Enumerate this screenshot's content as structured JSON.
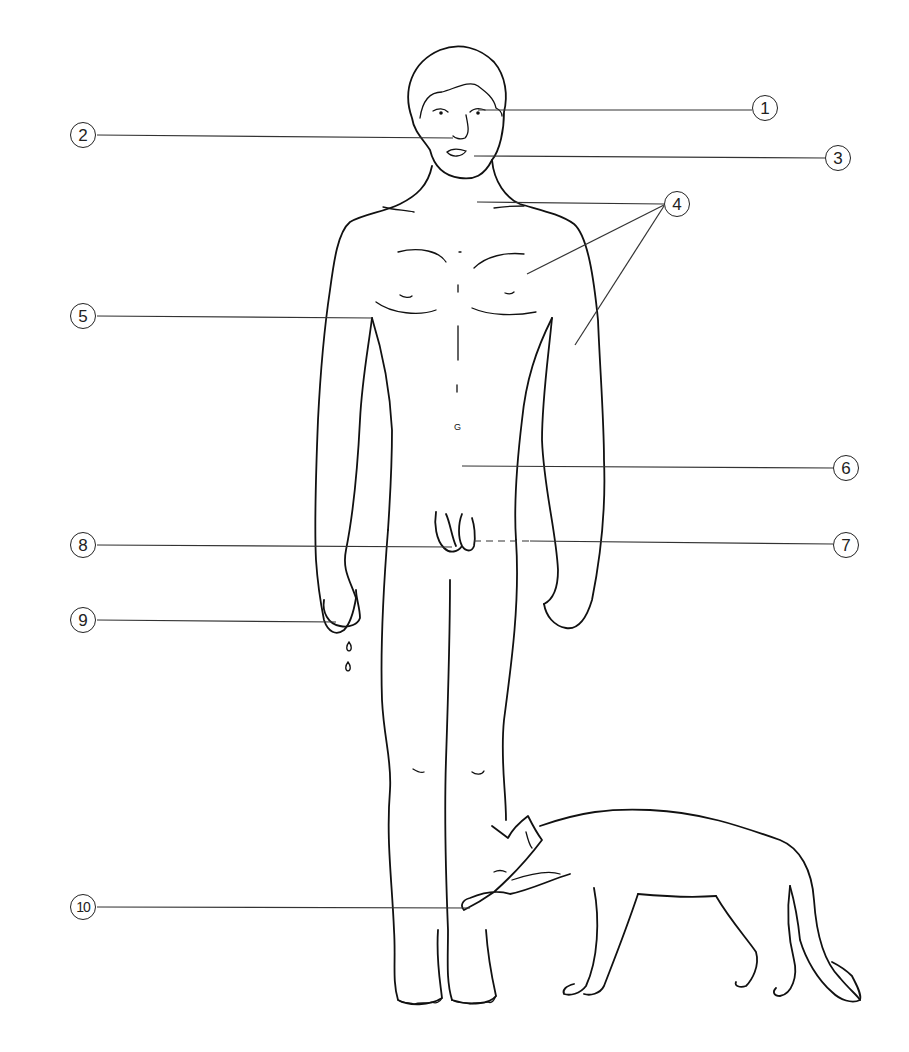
{
  "diagram": {
    "type": "anatomical-callout-illustration",
    "subjects": [
      "human-figure",
      "fox"
    ],
    "colors": {
      "line": "#111111",
      "background": "#ffffff"
    },
    "callouts": [
      {
        "id": 1,
        "label": "1",
        "x": 765,
        "y": 108,
        "target": "eyes"
      },
      {
        "id": 2,
        "label": "2",
        "x": 83,
        "y": 135,
        "target": "nose"
      },
      {
        "id": 3,
        "label": "3",
        "x": 838,
        "y": 158,
        "target": "mouth"
      },
      {
        "id": 4,
        "label": "4",
        "x": 677,
        "y": 204,
        "target": "neck-chest-arm"
      },
      {
        "id": 5,
        "label": "5",
        "x": 83,
        "y": 316,
        "target": "armpit"
      },
      {
        "id": 6,
        "label": "6",
        "x": 846,
        "y": 468,
        "target": "abdomen"
      },
      {
        "id": 7,
        "label": "7",
        "x": 846,
        "y": 545,
        "target": "buttocks"
      },
      {
        "id": 8,
        "label": "8",
        "x": 83,
        "y": 545,
        "target": "genitals"
      },
      {
        "id": 9,
        "label": "9",
        "x": 83,
        "y": 620,
        "target": "fingertips-dripping"
      },
      {
        "id": 10,
        "label": "10",
        "x": 83,
        "y": 907,
        "target": "lower-leg-bitten-by-fox"
      }
    ]
  }
}
